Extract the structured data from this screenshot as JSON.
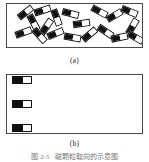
{
  "figure": {
    "panels": [
      {
        "id": "panel-a",
        "label": "(a)",
        "description": "randomly oriented magnetic particles",
        "arrangement": "random",
        "particle_count": 19,
        "particles": [
          {
            "x": 10,
            "y": 5,
            "rot": -38
          },
          {
            "x": 27,
            "y": 3,
            "rot": -18
          },
          {
            "x": 41,
            "y": 10,
            "rot": 70
          },
          {
            "x": 55,
            "y": 6,
            "rot": 14
          },
          {
            "x": 66,
            "y": 16,
            "rot": -8
          },
          {
            "x": 84,
            "y": 4,
            "rot": 28
          },
          {
            "x": 99,
            "y": 8,
            "rot": -30
          },
          {
            "x": 114,
            "y": 4,
            "rot": 22
          },
          {
            "x": 18,
            "y": 15,
            "rot": 62
          },
          {
            "x": 31,
            "y": 19,
            "rot": -56
          },
          {
            "x": 8,
            "y": 25,
            "rot": -20
          },
          {
            "x": 24,
            "y": 28,
            "rot": 48
          },
          {
            "x": 40,
            "y": 26,
            "rot": -22
          },
          {
            "x": 57,
            "y": 30,
            "rot": 10
          },
          {
            "x": 74,
            "y": 27,
            "rot": -40
          },
          {
            "x": 90,
            "y": 24,
            "rot": 34
          },
          {
            "x": 104,
            "y": 30,
            "rot": -12
          },
          {
            "x": 117,
            "y": 19,
            "rot": -60
          },
          {
            "x": 120,
            "y": 30,
            "rot": 30
          }
        ]
      },
      {
        "id": "panel-b",
        "label": "(b)",
        "description": "aligned magnetic particles in ordered rows",
        "arrangement": "aligned",
        "rows": 3,
        "columns": 5,
        "particle_count": 15
      }
    ],
    "particle_style": {
      "dark_fraction": "56%",
      "dark_color": "#111111",
      "light_color": "#ffffff",
      "outline_color": "#111111"
    },
    "frame_color": "#4a4a4a",
    "background_color": "#ffffff"
  },
  "caption": {
    "number": "图 2-5",
    "text": "磁颗粒取向的示意图"
  }
}
